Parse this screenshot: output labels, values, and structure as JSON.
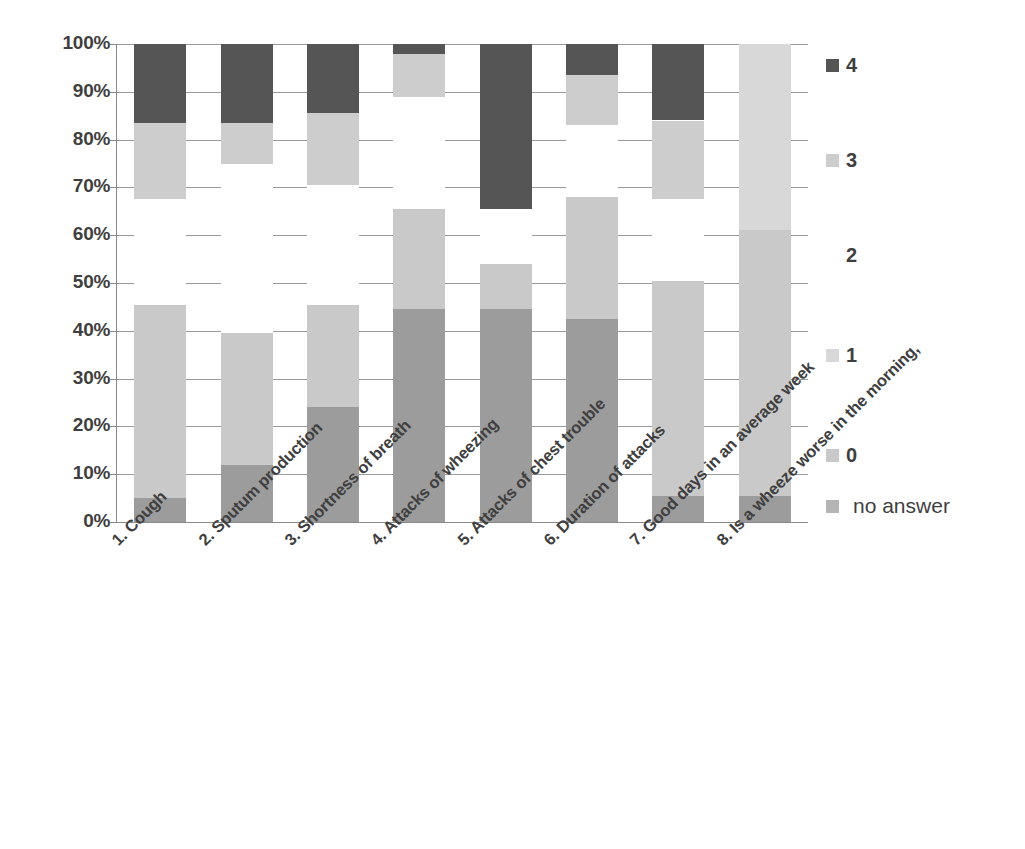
{
  "chart_data": {
    "type": "bar",
    "subtype": "stacked-percentage-column",
    "title": "",
    "subtitle": "",
    "xlabel": "",
    "ylabel": "",
    "ylim": [
      0,
      100
    ],
    "grid": true,
    "legend_position": "right",
    "ytick_labels": [
      "100%",
      "90%",
      "80%",
      "70%",
      "60%",
      "50%",
      "40%",
      "30%",
      "20%",
      "10%",
      "0%"
    ],
    "ytick_values": [
      100,
      90,
      80,
      70,
      60,
      50,
      40,
      30,
      20,
      10,
      0
    ],
    "categories": [
      "1. Cough",
      "2. Sputum production",
      "3. Shortness of breath",
      "4. Attacks of wheezing",
      "5. Attacks of chest trouble",
      "6. Duration of attacks",
      "7. Good days in an average week",
      "8. Is a wheeze worse in the morning,"
    ],
    "series": [
      {
        "name": "no answer",
        "color": "#9c9c9c",
        "values": [
          5.0,
          12.0,
          24.0,
          44.5,
          44.5,
          42.5,
          5.5,
          5.5
        ]
      },
      {
        "name": "0",
        "color": "#c9c9c9",
        "values": [
          40.5,
          27.5,
          21.5,
          21.0,
          9.5,
          25.5,
          45.0,
          55.5
        ]
      },
      {
        "name": "1",
        "color": "#d8d8d8",
        "values": [
          0,
          0,
          0,
          0,
          0,
          0,
          0,
          39.0
        ]
      },
      {
        "name": "2",
        "color": "#ffffff",
        "values": [
          22.0,
          35.5,
          25.0,
          23.5,
          11.5,
          15.0,
          17.0,
          0
        ]
      },
      {
        "name": "3",
        "color": "#cdcdcd",
        "values": [
          16.0,
          8.5,
          15.0,
          9.0,
          0,
          10.5,
          16.5,
          0
        ]
      },
      {
        "name": "4",
        "color": "#555555",
        "values": [
          16.5,
          16.5,
          14.5,
          2.0,
          34.5,
          6.5,
          16.0,
          0
        ]
      }
    ],
    "legend_entries": [
      {
        "label": "4",
        "color": "#555555",
        "swatch_visible": true
      },
      {
        "label": "3",
        "color": "#cdcdcd",
        "swatch_visible": true
      },
      {
        "label": "2",
        "color": "#ffffff",
        "swatch_visible": false
      },
      {
        "label": "1",
        "color": "#d8d8d8",
        "swatch_visible": true
      },
      {
        "label": "0",
        "color": "#c9c9c9",
        "swatch_visible": true
      },
      {
        "label": "no answer",
        "color": "#b4b4b4",
        "swatch_visible": true
      }
    ]
  },
  "colors": {
    "axis": "#8a8a8a",
    "grid": "#9b9b9b",
    "text": "#3f3f3f",
    "background": "#ffffff"
  }
}
